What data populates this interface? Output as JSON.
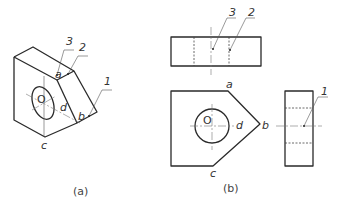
{
  "figure_a": {
    "caption": "(a)",
    "vertex_labels": {
      "a": "a",
      "b": "b",
      "c": "c",
      "d": "d",
      "o": "O"
    },
    "leaders": [
      "1",
      "2",
      "3"
    ]
  },
  "figure_b": {
    "caption": "(b)",
    "top_view_leaders": [
      "3",
      "2"
    ],
    "front_view_labels": {
      "a": "a",
      "b": "b",
      "c": "c",
      "d": "d",
      "o": "O"
    },
    "side_view_leaders": [
      "1"
    ]
  },
  "colors": {
    "line": "#2a2a2a",
    "text": "#333333",
    "background": "#ffffff"
  }
}
